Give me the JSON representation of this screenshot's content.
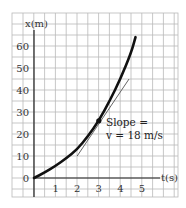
{
  "chart_data": {
    "type": "line",
    "title": "",
    "xlabel": "t(s)",
    "ylabel": "x(m)",
    "xlim": [
      -1,
      6.5
    ],
    "ylim": [
      -8,
      75
    ],
    "x_ticks": [
      1,
      2,
      3,
      4,
      5
    ],
    "x_tick_labels": [
      "1",
      "2",
      "3",
      "4",
      "5"
    ],
    "y_ticks": [
      0,
      10,
      20,
      30,
      40,
      50,
      60
    ],
    "y_tick_labels": [
      "0",
      "10",
      "20",
      "30",
      "40",
      "50",
      "60"
    ],
    "grid": true,
    "series": [
      {
        "name": "position curve",
        "x": [
          0,
          0.5,
          1,
          1.5,
          2,
          2.5,
          3,
          3.5,
          4,
          4.5,
          4.7
        ],
        "y": [
          0,
          2.5,
          5.5,
          9,
          13,
          19,
          26,
          35,
          45,
          57,
          64
        ]
      },
      {
        "name": "tangent line",
        "x": [
          2,
          4.4
        ],
        "y": [
          10,
          45
        ]
      }
    ],
    "highlight_point": {
      "x": 3,
      "y": 26
    },
    "annotations": [
      {
        "text": "Slope =",
        "x": 3.3,
        "y": 25
      },
      {
        "text": "v = 18 m/s",
        "x": 3.3,
        "y": 17
      }
    ]
  }
}
